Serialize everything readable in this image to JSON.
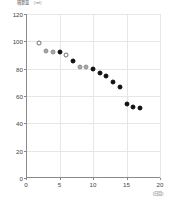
{
  "chart_data": {
    "type": "scatter",
    "title": "",
    "ylabel": "積算量",
    "yunit": "（ml）",
    "xlabel": "（日目）",
    "xlim": [
      0,
      20
    ],
    "ylim": [
      0,
      120
    ],
    "xticks": [
      0,
      5,
      10,
      15,
      20
    ],
    "yticks": [
      0,
      20,
      40,
      60,
      80,
      100,
      120
    ],
    "grid": true,
    "legend": "none",
    "series": [
      {
        "name": "open",
        "marker": "open-circle",
        "color": "#ffffff",
        "points": [
          {
            "x": 2,
            "y": 99
          },
          {
            "x": 6,
            "y": 90
          }
        ]
      },
      {
        "name": "gray",
        "marker": "gray-circle",
        "color": "#a8a8a8",
        "points": [
          {
            "x": 3,
            "y": 93
          },
          {
            "x": 4,
            "y": 92
          },
          {
            "x": 8,
            "y": 81
          },
          {
            "x": 9,
            "y": 81
          }
        ]
      },
      {
        "name": "filled",
        "marker": "filled-circle",
        "color": "#111111",
        "points": [
          {
            "x": 5,
            "y": 92.5
          },
          {
            "x": 7,
            "y": 85.5
          },
          {
            "x": 10,
            "y": 80
          },
          {
            "x": 11,
            "y": 77
          },
          {
            "x": 12,
            "y": 74.5
          },
          {
            "x": 13,
            "y": 70.5
          },
          {
            "x": 14,
            "y": 66.5
          },
          {
            "x": 15,
            "y": 54
          },
          {
            "x": 16,
            "y": 52
          },
          {
            "x": 17,
            "y": 51.5
          }
        ]
      }
    ]
  }
}
